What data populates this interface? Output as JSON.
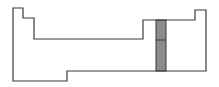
{
  "diagram": {
    "type": "periodic-table-outline",
    "outline_color": "#3a3a3a",
    "highlight_color": "#8c8c8c",
    "highlighted_group": {
      "description": "single shaded column spanning rows 2-6 of p-block",
      "cells": 2
    },
    "outline_points": "13,8 23,8 23,18 34,18 34,39 143,39 143,20 195,20 195,10 206,10 206,71 67,71 67,81 13,81",
    "highlight": {
      "x": 156,
      "y": 20,
      "width": 10,
      "height": 51,
      "divider_y": 40
    }
  }
}
